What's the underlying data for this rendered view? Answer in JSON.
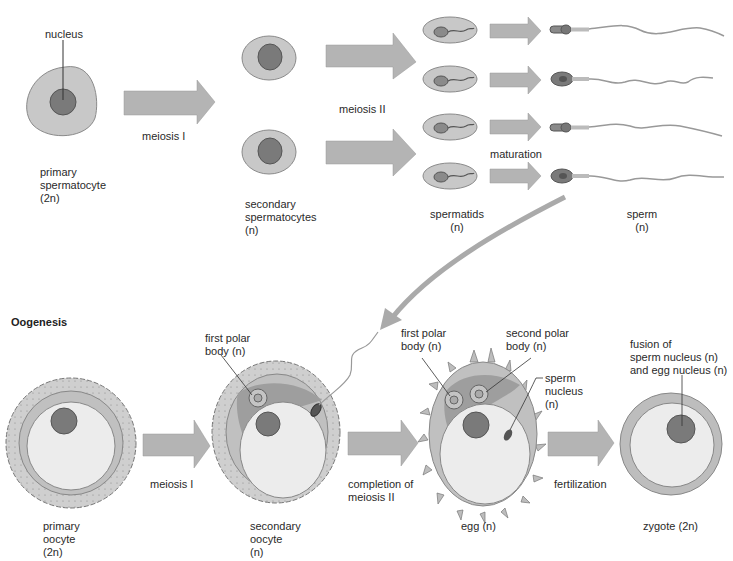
{
  "spermatogenesis": {
    "labels": {
      "nucleus": "nucleus",
      "primary": "primary\nspermatocyte\n(2n)",
      "meiosis1": "meiosis I",
      "secondary": "secondary\nspermatocytes\n(n)",
      "meiosis2": "meiosis II",
      "spermatids": "spermatids\n(n)",
      "maturation": "maturation",
      "sperm": "sperm\n(n)"
    },
    "counts": {
      "secondary_spermatocytes": 2,
      "spermatids": 4,
      "sperm": 4
    }
  },
  "oogenesis": {
    "heading": "Oogenesis",
    "labels": {
      "primary": "primary\noocyte\n(2n)",
      "meiosis1": "meiosis I",
      "first_polar_secondary": "first polar\nbody (n)",
      "secondary": "secondary\noocyte\n(n)",
      "completion": "completion of\nmeiosis II",
      "first_polar_egg": "first polar\nbody (n)",
      "second_polar": "second polar\nbody (n)",
      "sperm_nucleus": "sperm\nnucleus\n(n)",
      "egg": "egg (n)",
      "fertilization": "fertilization",
      "fusion": "fusion of\nsperm nucleus (n)\nand egg nucleus (n)",
      "zygote": "zygote (2n)"
    }
  },
  "colors": {
    "cytoplasm": "#c8c8c8",
    "cell_outline": "#8a8a8a",
    "nucleus": "#7a7a7a",
    "arrow": "#b4b4b4",
    "egg_interior": "#ececec",
    "zona": "#bdbdbd",
    "polar_region": "#9e9e9e"
  }
}
